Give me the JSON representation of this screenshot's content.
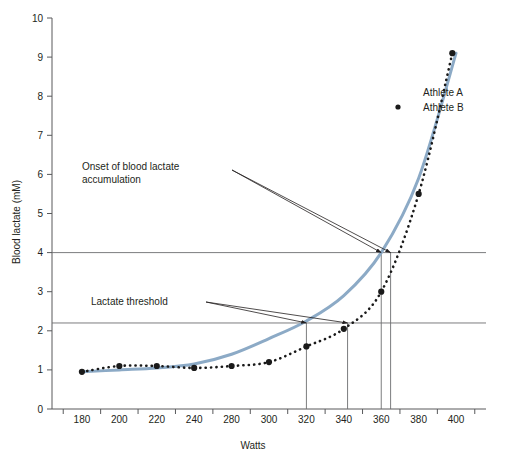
{
  "chart_data": {
    "type": "line",
    "title": "",
    "xlabel": "Watts",
    "ylabel": "Blood lactate (mM)",
    "xlim": [
      170,
      410
    ],
    "ylim": [
      0,
      10
    ],
    "grid": false,
    "x_ticks": [
      180,
      200,
      220,
      240,
      280,
      300,
      320,
      340,
      360,
      380,
      400
    ],
    "x_tick_labels": [
      "180",
      "200",
      "220",
      "240",
      "280",
      "300",
      "320",
      "340",
      "360",
      "380",
      "400"
    ],
    "y_ticks": [
      0,
      1,
      2,
      3,
      4,
      5,
      6,
      7,
      8,
      9,
      10
    ],
    "y_tick_labels": [
      "0",
      "1",
      "2",
      "3",
      "4",
      "5",
      "6",
      "7",
      "8",
      "9",
      "10"
    ],
    "legend_position": "top-right",
    "series": [
      {
        "name": "Athlete A",
        "style": "solid",
        "color": "#8CAAC6",
        "markers": false,
        "x": [
          180,
          200,
          220,
          240,
          260,
          280,
          300,
          320,
          340,
          360,
          380
        ],
        "values": [
          0.95,
          1.0,
          1.05,
          1.15,
          1.4,
          1.8,
          2.25,
          2.9,
          4.0,
          5.9,
          9.1
        ]
      },
      {
        "name": "Athlete B",
        "style": "dotted",
        "color": "#1a1a1a",
        "markers": true,
        "x": [
          180,
          200,
          220,
          240,
          260,
          280,
          300,
          320,
          340,
          360,
          378
        ],
        "values": [
          0.95,
          1.1,
          1.1,
          1.05,
          1.1,
          1.2,
          1.6,
          2.05,
          3.0,
          5.5,
          9.1
        ]
      }
    ],
    "reference_lines": [
      {
        "name": "obla-level",
        "orientation": "horizontal",
        "value": 4.0
      },
      {
        "name": "lactate-threshold-level",
        "orientation": "horizontal",
        "value": 2.2
      }
    ],
    "drop_lines": [
      {
        "name": "athlete-a-lactate-threshold",
        "x": 300,
        "y": 2.2
      },
      {
        "name": "athlete-b-lactate-threshold",
        "x": 322,
        "y": 2.2
      },
      {
        "name": "athlete-b-obla",
        "x": 340,
        "y": 4.0
      },
      {
        "name": "athlete-a-obla",
        "x": 345,
        "y": 4.0
      }
    ],
    "annotations": [
      {
        "name": "obla-annotation",
        "text_line1": "Onset of blood lactate",
        "text_line2": "accumulation",
        "points_to": [
          [
            340,
            4.0
          ],
          [
            345,
            4.0
          ]
        ]
      },
      {
        "name": "lactate-threshold-annotation",
        "text_line1": "Lactate threshold",
        "text_line2": "",
        "points_to": [
          [
            300,
            2.2
          ],
          [
            322,
            2.2
          ]
        ]
      }
    ]
  },
  "legend": {
    "items": [
      {
        "label": "Athlete A",
        "color": "#8CAAC6",
        "style": "solid"
      },
      {
        "label": "Athlete B",
        "color": "#1a1a1a",
        "style": "dotted"
      }
    ]
  },
  "axes": {
    "x_title": "Watts",
    "y_title": "Blood lactate (mM)"
  }
}
